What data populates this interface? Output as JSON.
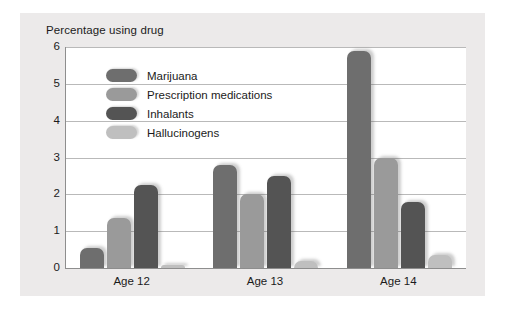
{
  "chart_data": {
    "type": "bar",
    "title": "Percentage using drug",
    "xlabel": "",
    "ylabel": "",
    "categories": [
      "Age 12",
      "Age 13",
      "Age 14"
    ],
    "ylim": [
      0,
      6
    ],
    "yticks": [
      0,
      1,
      2,
      3,
      4,
      5,
      6
    ],
    "ytick_labels": [
      "0",
      "1",
      "2",
      "3",
      "4",
      "5",
      "6"
    ],
    "grid": true,
    "legend_position": "upper-left-inside",
    "series": [
      {
        "name": "Marijuana",
        "color": "#6e6e6e",
        "values": [
          0.55,
          2.8,
          5.9
        ]
      },
      {
        "name": "Prescription medications",
        "color": "#9a9a9a",
        "values": [
          1.35,
          2.0,
          3.0
        ]
      },
      {
        "name": "Inhalants",
        "color": "#545454",
        "values": [
          2.25,
          2.5,
          1.8
        ]
      },
      {
        "name": "Hallucinogens",
        "color": "#bfbfbf",
        "values": [
          0.08,
          0.2,
          0.35
        ]
      }
    ]
  },
  "figure": {
    "background_color": "#eceaea",
    "plot_background_color": "#ffffff",
    "axis_color": "#8e8e8e",
    "gridline_color": "#b9b9b9",
    "text_color": "#1b1b1b"
  }
}
